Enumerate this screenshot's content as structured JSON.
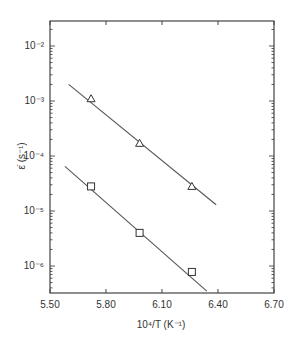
{
  "chart_data": {
    "type": "scatter",
    "title": "",
    "xlabel": "10⁴/T (K⁻¹)",
    "ylabel": "ε̇ (s⁻¹)",
    "xlim": [
      5.5,
      6.7
    ],
    "ylim_log10": [
      -2.45,
      -6.5
    ],
    "yscale": "log",
    "x_ticks": [
      "5.50",
      "5.80",
      "6.10",
      "6.40",
      "6.70"
    ],
    "x_tick_values": [
      5.5,
      5.8,
      6.1,
      6.4,
      6.7
    ],
    "y_ticks": [
      "10⁻²",
      "10⁻³",
      "10⁻⁴",
      "10⁻⁵",
      "10⁻⁶"
    ],
    "y_tick_exponents": [
      -2,
      -3,
      -4,
      -5,
      -6
    ],
    "grid": false,
    "legend": null,
    "series": [
      {
        "name": "triangles",
        "marker": "triangle-open",
        "x": [
          5.72,
          5.98,
          6.26
        ],
        "y": [
          0.0011,
          0.00017,
          2.8e-05
        ],
        "fit_line": {
          "x": [
            5.6,
            6.39
          ],
          "y": [
            0.002,
            1.3e-05
          ]
        }
      },
      {
        "name": "squares",
        "marker": "square-open",
        "x": [
          5.72,
          5.98,
          6.26
        ],
        "y": [
          2.8e-05,
          4e-06,
          7.8e-07
        ],
        "fit_line": {
          "x": [
            5.58,
            6.34
          ],
          "y": [
            6.5e-05,
            3.5e-07
          ]
        }
      }
    ]
  }
}
